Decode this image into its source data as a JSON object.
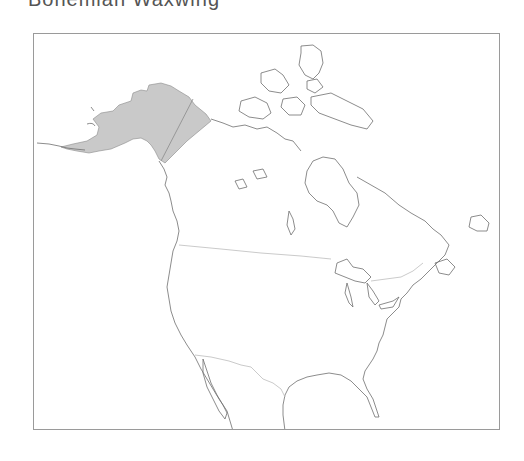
{
  "title": "Bohemian Waxwing",
  "map": {
    "region": "North America",
    "range_fill_color": "#c9c9c9",
    "coastline_color": "#6f6f6f",
    "border_color": "#bdbdbd",
    "frame_color": "#9a9a9a",
    "shaded_range": "Alaska and western Yukon",
    "legend": []
  }
}
